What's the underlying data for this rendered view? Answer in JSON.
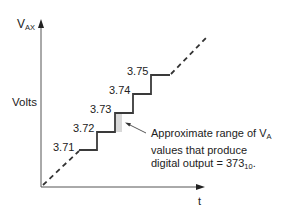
{
  "diagram": {
    "y_axis": {
      "label_main": "V",
      "label_sub": "AX",
      "unit_label": "Volts"
    },
    "x_axis": {
      "label": "t"
    },
    "steps": [
      {
        "label": "3.71"
      },
      {
        "label": "3.72"
      },
      {
        "label": "3.73"
      },
      {
        "label": "3.74"
      },
      {
        "label": "3.75"
      }
    ],
    "annotation": {
      "line1_prefix": "Approximate range of V",
      "line1_sub": "A",
      "line2": "values that produce",
      "line3_prefix": "digital output = 373",
      "line3_sub": "10",
      "line3_suffix": "."
    },
    "colors": {
      "line": "#3a3a3a",
      "shade": "#d8d8d8",
      "axis": "#555555"
    }
  }
}
